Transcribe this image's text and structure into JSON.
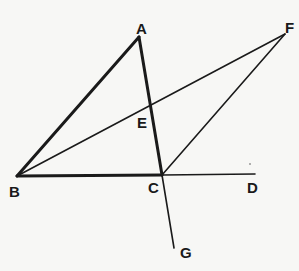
{
  "diagram": {
    "title": "",
    "points": {
      "A": {
        "label": "A",
        "x": 139,
        "y": 37,
        "lx": 136,
        "ly": 34
      },
      "B": {
        "label": "B",
        "x": 17,
        "y": 176,
        "lx": 9,
        "ly": 197
      },
      "C": {
        "label": "C",
        "x": 162,
        "y": 175,
        "lx": 148,
        "ly": 192
      },
      "D": {
        "label": "D",
        "x": 255,
        "y": 174,
        "lx": 247,
        "ly": 192
      },
      "E": {
        "label": "E",
        "x": 151,
        "y": 103,
        "lx": 137,
        "ly": 127
      },
      "F": {
        "label": "F",
        "x": 285,
        "y": 34,
        "lx": 286,
        "ly": 33
      },
      "G": {
        "label": "G",
        "x": 174,
        "y": 248,
        "lx": 180,
        "ly": 257
      }
    },
    "segments": [
      {
        "from": "A",
        "to": "B",
        "weight": "thick"
      },
      {
        "from": "A",
        "to": "C",
        "weight": "thick"
      },
      {
        "from": "B",
        "to": "C",
        "weight": "thick"
      },
      {
        "from": "C",
        "to": "G",
        "weight": "thin"
      },
      {
        "from": "C",
        "to": "D",
        "weight": "thin"
      },
      {
        "from": "B",
        "to": "F",
        "weight": "thin"
      },
      {
        "from": "C",
        "to": "F",
        "weight": "thin"
      }
    ],
    "labels": {
      "A": "A",
      "B": "B",
      "C": "C",
      "D": "D",
      "E": "E",
      "F": "F",
      "G": "G"
    },
    "colors": {
      "ink": "#1a1a1a",
      "paper": "#f7f7f5"
    }
  }
}
